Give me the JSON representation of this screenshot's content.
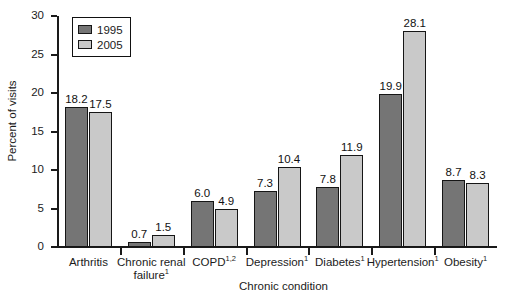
{
  "chart_data": {
    "type": "bar",
    "title": "",
    "xlabel": "Chronic condition",
    "ylabel": "Percent of visits",
    "ylim": [
      0,
      30
    ],
    "yticks": [
      0,
      5,
      10,
      15,
      20,
      25,
      30
    ],
    "grid": false,
    "legend_position": "top-left-inside",
    "categories": [
      "Arthritis",
      "Chronic renal failure¹",
      "COPD¹'²",
      "Depression¹",
      "Diabetes¹",
      "Hypertension¹",
      "Obesity¹"
    ],
    "category_lines": [
      [
        "Arthritis"
      ],
      [
        "Chronic renal",
        "failure"
      ],
      [
        "COPD"
      ],
      [
        "Depression"
      ],
      [
        "Diabetes"
      ],
      [
        "Hypertension"
      ],
      [
        "Obesity"
      ]
    ],
    "category_superscripts": [
      "",
      "1",
      "1,2",
      "1",
      "1",
      "1",
      "1"
    ],
    "series": [
      {
        "name": "1995",
        "color": "#757575",
        "values": [
          18.2,
          0.7,
          6.0,
          7.3,
          7.8,
          19.9,
          8.7
        ]
      },
      {
        "name": "2005",
        "color": "#c9c9c9",
        "values": [
          17.5,
          1.5,
          4.9,
          10.4,
          11.9,
          28.1,
          8.3
        ]
      }
    ],
    "value_labels": {
      "1995": [
        "18.2",
        "0.7",
        "6.0",
        "7.3",
        "7.8",
        "19.9",
        "8.7"
      ],
      "2005": [
        "17.5",
        "1.5",
        "4.9",
        "10.4",
        "11.9",
        "28.1",
        "8.3"
      ]
    }
  },
  "legend": {
    "items": [
      {
        "label": "1995",
        "swatch": "dark-gray-swatch"
      },
      {
        "label": "2005",
        "swatch": "light-gray-swatch"
      }
    ]
  },
  "axes": {
    "y_title": "Percent of visits",
    "x_title": "Chronic condition",
    "y_tick_labels": [
      "30",
      "25",
      "20",
      "15",
      "10",
      "5",
      "0"
    ]
  },
  "colors": {
    "series_1995": "#757575",
    "series_2005": "#c9c9c9",
    "axis": "#1a1a1a",
    "text": "#1b1b1b",
    "background": "#ffffff"
  }
}
